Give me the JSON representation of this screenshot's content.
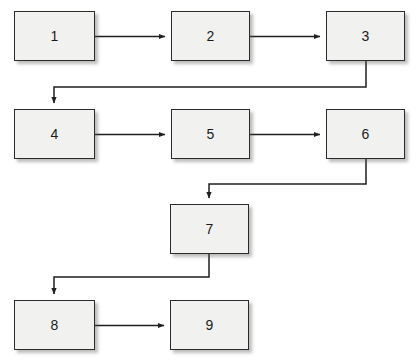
{
  "diagram": {
    "type": "flowchart",
    "canvas": {
      "width": 417,
      "height": 363,
      "background": "#ffffff"
    },
    "style": {
      "node_fill": "#f1f1ef",
      "node_border": "#2b2b2b",
      "node_shadow": "#5a5a5a",
      "edge_color": "#1f1f1f",
      "label_color": "#1b1b1b"
    },
    "nodes": [
      {
        "id": "n1",
        "label": "1",
        "x": 14,
        "y": 11,
        "w": 81,
        "h": 50
      },
      {
        "id": "n2",
        "label": "2",
        "x": 171,
        "y": 11,
        "w": 79,
        "h": 50
      },
      {
        "id": "n3",
        "label": "3",
        "x": 326,
        "y": 11,
        "w": 79,
        "h": 50
      },
      {
        "id": "n4",
        "label": "4",
        "x": 14,
        "y": 109,
        "w": 81,
        "h": 50
      },
      {
        "id": "n5",
        "label": "5",
        "x": 171,
        "y": 109,
        "w": 79,
        "h": 50
      },
      {
        "id": "n6",
        "label": "6",
        "x": 326,
        "y": 109,
        "w": 79,
        "h": 50
      },
      {
        "id": "n7",
        "label": "7",
        "x": 170,
        "y": 204,
        "w": 79,
        "h": 50
      },
      {
        "id": "n8",
        "label": "8",
        "x": 14,
        "y": 300,
        "w": 81,
        "h": 50
      },
      {
        "id": "n9",
        "label": "9",
        "x": 170,
        "y": 300,
        "w": 79,
        "h": 50
      }
    ],
    "edges": [
      {
        "id": "e1",
        "from": "1",
        "to": "2",
        "kind": "straight-right",
        "arrow": true
      },
      {
        "id": "e2",
        "from": "2",
        "to": "3",
        "kind": "straight-right",
        "arrow": true
      },
      {
        "id": "e3",
        "from": "3",
        "to": "4",
        "kind": "down-left-down",
        "arrow": true
      },
      {
        "id": "e4",
        "from": "4",
        "to": "5",
        "kind": "straight-right",
        "arrow": true
      },
      {
        "id": "e5",
        "from": "5",
        "to": "6",
        "kind": "straight-right",
        "arrow": true
      },
      {
        "id": "e6",
        "from": "6",
        "to": "7",
        "kind": "down-left-down",
        "arrow": true
      },
      {
        "id": "e7",
        "from": "7",
        "to": "8",
        "kind": "down-left-down",
        "arrow": true
      },
      {
        "id": "e8",
        "from": "8",
        "to": "9",
        "kind": "straight-right",
        "arrow": true
      }
    ]
  }
}
